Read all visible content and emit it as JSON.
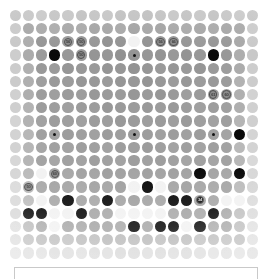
{
  "app": {
    "title": "Go Board",
    "board_label": "go-board"
  },
  "board": {
    "size": 19,
    "columns": 19,
    "rows": 19,
    "colors": {
      "empty": "#8d8d8d",
      "black_stone": "#0a0a0a",
      "white_stone": "#f2f2f2",
      "edge_dim": "#b4b4b4",
      "background": "#ffffff",
      "panel_border": "#c9c9c9"
    },
    "star_points": [
      [
        3,
        3
      ],
      [
        9,
        3
      ],
      [
        15,
        3
      ],
      [
        3,
        9
      ],
      [
        9,
        9
      ],
      [
        15,
        9
      ],
      [
        3,
        15
      ],
      [
        9,
        15
      ],
      [
        15,
        15
      ]
    ],
    "black_stones": [
      [
        3,
        3
      ],
      [
        15,
        3
      ],
      [
        17,
        9
      ],
      [
        14,
        12
      ],
      [
        17,
        12
      ],
      [
        10,
        13
      ],
      [
        4,
        14
      ],
      [
        7,
        14
      ],
      [
        12,
        14
      ],
      [
        13,
        14
      ],
      [
        15,
        15
      ],
      [
        1,
        15
      ],
      [
        2,
        15
      ],
      [
        5,
        15
      ],
      [
        9,
        16
      ],
      [
        11,
        16
      ],
      [
        12,
        16
      ],
      [
        14,
        16
      ]
    ],
    "white_stones": [
      [
        9,
        2
      ],
      [
        2,
        12
      ],
      [
        9,
        13
      ],
      [
        11,
        13
      ],
      [
        2,
        14
      ],
      [
        16,
        14
      ],
      [
        17,
        14
      ],
      [
        3,
        15
      ],
      [
        4,
        15
      ],
      [
        8,
        15
      ],
      [
        9,
        15
      ],
      [
        10,
        15
      ],
      [
        11,
        15
      ],
      [
        3,
        16
      ],
      [
        13,
        16
      ]
    ],
    "move_markers": [
      {
        "col": 4,
        "row": 2,
        "label": "56",
        "on": "empty"
      },
      {
        "col": 5,
        "row": 2,
        "label": "50",
        "on": "empty"
      },
      {
        "col": 11,
        "row": 2,
        "label": "56",
        "on": "empty"
      },
      {
        "col": 12,
        "row": 2,
        "label": "66",
        "on": "empty"
      },
      {
        "col": 5,
        "row": 3,
        "label": "50",
        "on": "empty"
      },
      {
        "col": 15,
        "row": 6,
        "label": "61",
        "on": "empty"
      },
      {
        "col": 16,
        "row": 6,
        "label": "60",
        "on": "empty"
      },
      {
        "col": 3,
        "row": 12,
        "label": "60",
        "on": "empty"
      },
      {
        "col": 1,
        "row": 13,
        "label": "50",
        "on": "empty"
      },
      {
        "col": 14,
        "row": 14,
        "label": "34",
        "on": "black"
      }
    ]
  },
  "bottom_panel": {
    "name": "status-bar"
  }
}
